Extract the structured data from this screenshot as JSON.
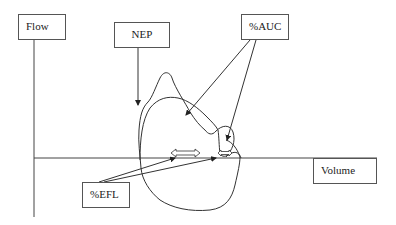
{
  "diagram": {
    "type": "flow-volume loop annotation diagram",
    "axes": {
      "y_label": "Flow",
      "x_label": "Volume"
    },
    "labels": {
      "nep": "NEP",
      "auc": "%AUC",
      "efl": "%EFL"
    },
    "elements": [
      {
        "id": "flow-axis",
        "kind": "vertical axis"
      },
      {
        "id": "volume-axis",
        "kind": "horizontal axis"
      },
      {
        "id": "outer-loop",
        "kind": "flow-volume curve (control)"
      },
      {
        "id": "inner-loop",
        "kind": "flow-volume curve (NEP)"
      },
      {
        "id": "efl-arrow-1",
        "kind": "double-headed arrow"
      },
      {
        "id": "efl-arrow-2",
        "kind": "double-headed arrow"
      }
    ],
    "colors": {
      "stroke": "#333333",
      "box_border": "#555555",
      "background": "#ffffff"
    }
  }
}
